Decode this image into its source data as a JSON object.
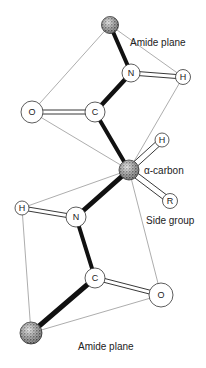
{
  "labels": {
    "amide_plane_top": "Amide plane",
    "alpha_carbon": "α-carbon",
    "side_group": "Side group",
    "amide_plane_bottom": "Amide plane"
  },
  "atoms": {
    "ca_top": {
      "symbol": "",
      "type": "stippled"
    },
    "n_top": {
      "symbol": "N"
    },
    "h_top": {
      "symbol": "H"
    },
    "o_top": {
      "symbol": "O"
    },
    "c_top": {
      "symbol": "C"
    },
    "ca_mid": {
      "symbol": "",
      "type": "stippled"
    },
    "h_ca": {
      "symbol": "H"
    },
    "r": {
      "symbol": "R"
    },
    "h_bot": {
      "symbol": "H"
    },
    "n_bot": {
      "symbol": "N"
    },
    "c_bot": {
      "symbol": "C"
    },
    "o_bot": {
      "symbol": "O"
    },
    "ca_bot": {
      "symbol": "",
      "type": "stippled"
    }
  },
  "colors": {
    "bond": "#111111",
    "plane_line": "#888888",
    "atom_stroke": "#333333"
  }
}
